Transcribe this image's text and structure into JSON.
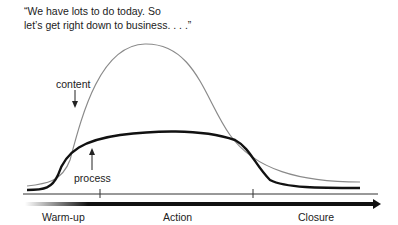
{
  "quote": {
    "line1": "“We have lots to do today. So",
    "line2": "let’s get right down to business. . . .”"
  },
  "curves": {
    "content_label": "content",
    "process_label": "process"
  },
  "phases": [
    {
      "label": "Warm-up"
    },
    {
      "label": "Action"
    },
    {
      "label": "Closure"
    }
  ],
  "colors": {
    "content_curve": "#8a8a8a",
    "process_curve": "#111111",
    "arrow": "#111111"
  }
}
